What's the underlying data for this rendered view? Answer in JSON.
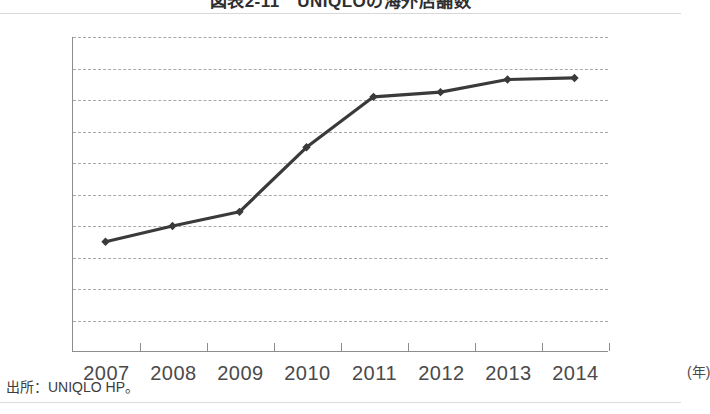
{
  "figure": {
    "title": "図表2-11　UNIQLOの海外店舗数",
    "source_note": "出所：UNIQLO HP。",
    "x_unit_label": "(年)"
  },
  "chart_data": {
    "type": "line",
    "title": "図表2-11　UNIQLOの海外店舗数",
    "xlabel": "(年)",
    "ylabel": "",
    "categories": [
      "2007",
      "2008",
      "2009",
      "2010",
      "2011",
      "2012",
      "2013",
      "2014"
    ],
    "values": [
      730,
      740,
      749,
      790,
      822,
      825,
      833,
      834
    ],
    "ylim": [
      660,
      860
    ],
    "yticks": [
      660,
      680,
      700,
      720,
      740,
      760,
      780,
      800,
      820,
      840,
      860
    ],
    "ytick_labels": [
      "660",
      "680",
      "700",
      "720",
      "740",
      "760",
      "780",
      "800",
      "820",
      "840",
      "860"
    ],
    "grid": "horizontal-dashed",
    "legend": "none",
    "series": [
      {
        "name": "海外店舗数",
        "values": [
          730,
          740,
          749,
          790,
          822,
          825,
          833,
          834
        ],
        "color": "#3a3a3a",
        "marker": "diamond"
      }
    ]
  },
  "style": {
    "line_color": "#3a3a3a",
    "grid_color": "#a9a9a9",
    "axis_color": "#8d8d8d",
    "text_color": "#4a4a4a",
    "background": "#ffffff"
  }
}
